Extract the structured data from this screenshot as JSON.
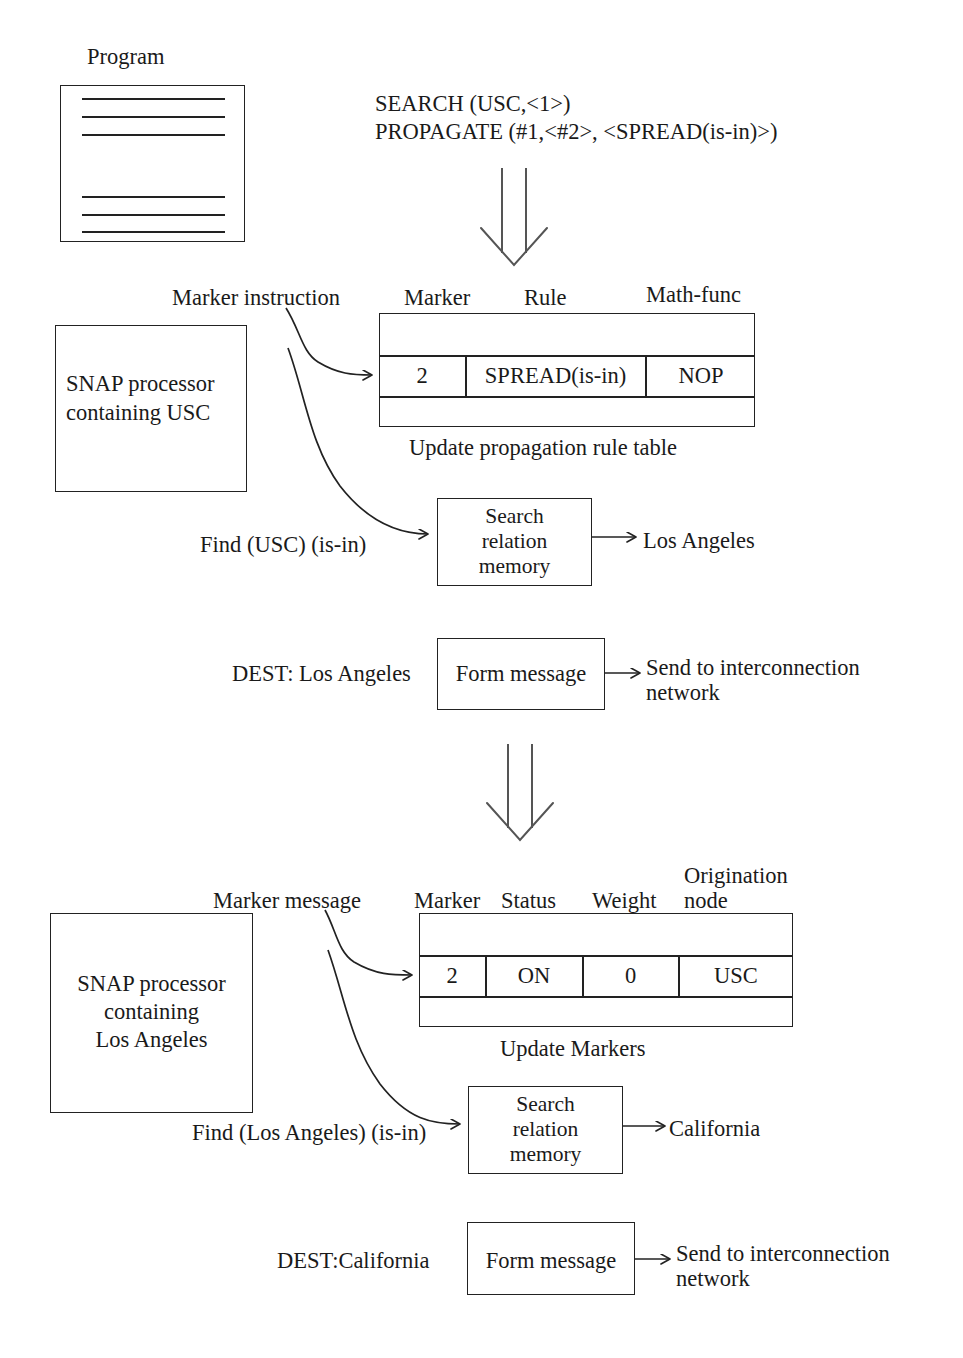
{
  "diagram": {
    "program_label": "Program",
    "instructions": {
      "line1": "SEARCH (USC,<1>)",
      "line2": "PROPAGATE (#1,<#2>, <SPREAD(is-in)>)"
    },
    "stage1": {
      "marker_instruction_label": "Marker instruction",
      "processor_line1": "SNAP processor",
      "processor_line2": "containing USC",
      "table": {
        "headers": [
          "Marker",
          "Rule",
          "Math-func"
        ],
        "row": [
          "2",
          "SPREAD(is-in)",
          "NOP"
        ],
        "caption": "Update propagation rule table"
      },
      "find_label": "Find (USC) (is-in)",
      "search_box_line1": "Search",
      "search_box_line2": "relation",
      "search_box_line3": "memory",
      "search_result": "Los Angeles",
      "dest_label": "DEST: Los Angeles",
      "form_message_label": "Form message",
      "send_line1": "Send to interconnection",
      "send_line2": "network"
    },
    "stage2": {
      "marker_message_label": "Marker message",
      "processor_line1": "SNAP processor",
      "processor_line2": "containing",
      "processor_line3": "Los Angeles",
      "table": {
        "headers": [
          "Marker",
          "Status",
          "Weight",
          "Origination",
          "node"
        ],
        "row": [
          "2",
          "ON",
          "0",
          "USC"
        ],
        "caption": "Update Markers"
      },
      "find_label": "Find (Los Angeles) (is-in)",
      "search_box_line1": "Search",
      "search_box_line2": "relation",
      "search_box_line3": "memory",
      "search_result": "California",
      "dest_label": "DEST:California",
      "form_message_label": "Form message",
      "send_line1": "Send to interconnection",
      "send_line2": "network"
    },
    "colors": {
      "ink": "#1a1a1a",
      "stroke": "#222222",
      "background": "#ffffff"
    }
  }
}
